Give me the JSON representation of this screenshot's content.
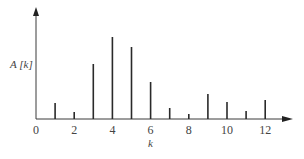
{
  "chart_data": {
    "type": "stem",
    "title": "",
    "xlabel": "k",
    "ylabel": "A[k]",
    "x": [
      1,
      2,
      3,
      4,
      5,
      6,
      7,
      8,
      9,
      10,
      11,
      12
    ],
    "values": [
      16,
      7,
      55,
      82,
      72,
      37,
      11,
      5,
      25,
      17,
      8,
      19
    ],
    "value_units": "relative stem height (unlabeled y-axis)",
    "x_ticks": [
      "0",
      "2",
      "4",
      "6",
      "8",
      "10",
      "12"
    ],
    "xlim": [
      0,
      13.5
    ],
    "ylim": [
      0,
      110
    ],
    "grid": false,
    "legend": null
  },
  "axes": {
    "x_label": "k",
    "y_label": "A [k]",
    "x_tick_labels": [
      "0",
      "2",
      "4",
      "6",
      "8",
      "10",
      "12"
    ]
  }
}
